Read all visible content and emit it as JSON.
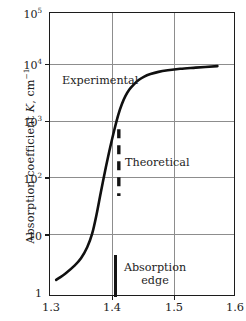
{
  "chart_data": {
    "type": "line",
    "title": "",
    "xlabel": "",
    "ylabel": "Absorption coefficient K, cm-1",
    "ylabel_parts": {
      "prefix": "Absorption coefficient ",
      "symbol": "K",
      "suffix": ", cm",
      "exponent": "-1"
    },
    "xlim": [
      1.3,
      1.6
    ],
    "ylim": [
      1,
      100000
    ],
    "yscale": "log",
    "xscale": "linear",
    "grid": "major-x-and-y",
    "legend": "none",
    "x_ticks": [
      "1.3",
      "1.4",
      "1.5",
      "1.6"
    ],
    "x_tick_values": [
      1.3,
      1.4,
      1.5,
      1.6
    ],
    "y_ticks": [
      "1",
      "10",
      "10^2",
      "10^3",
      "10^4",
      "10^5"
    ],
    "y_tick_values": [
      1,
      10,
      100,
      1000,
      10000,
      100000
    ],
    "y_tick_display": [
      {
        "mantissa": "1",
        "exp": ""
      },
      {
        "mantissa": "10",
        "exp": ""
      },
      {
        "mantissa": "10",
        "exp": "2"
      },
      {
        "mantissa": "10",
        "exp": "3"
      },
      {
        "mantissa": "10",
        "exp": "4"
      },
      {
        "mantissa": "10",
        "exp": "5"
      }
    ],
    "series": [
      {
        "name": "Experimental",
        "style": "solid",
        "color": "#101010",
        "x": [
          1.31,
          1.325,
          1.34,
          1.35,
          1.36,
          1.368,
          1.375,
          1.382,
          1.39,
          1.397,
          1.404,
          1.41,
          1.416,
          1.422,
          1.428,
          1.435,
          1.443,
          1.452,
          1.462,
          1.475,
          1.49,
          1.51,
          1.535,
          1.57
        ],
        "y": [
          2.0,
          2.6,
          3.6,
          4.8,
          7.5,
          13,
          28,
          70,
          190,
          430,
          900,
          1600,
          2500,
          3500,
          4500,
          5500,
          6600,
          7600,
          8400,
          9200,
          9800,
          10400,
          10900,
          11600
        ]
      }
    ],
    "annotations": [
      {
        "name": "experimental",
        "text": "Experimental",
        "x": 1.335,
        "y": 5000
      },
      {
        "name": "theoretical",
        "text": "Theoretical",
        "x": 1.423,
        "y": 260
      },
      {
        "name": "absorption-edge",
        "text": "Absorption edge",
        "line1": "Absorption",
        "line2": "edge",
        "x": 1.432,
        "y": 4.2
      }
    ],
    "markers": [
      {
        "name": "theoretical-dashed-line",
        "style": "dashed",
        "orientation": "vertical",
        "x": 1.411,
        "y_from": 60,
        "y_to": 900,
        "color": "#141414"
      },
      {
        "name": "absorption-edge-line",
        "style": "solid-thick",
        "orientation": "vertical",
        "x": 1.406,
        "y_from": 1,
        "y_to": 5.5,
        "color": "#141414"
      }
    ]
  },
  "annotations": {
    "experimental_label": "Experimental",
    "theoretical_label": "Theoretical",
    "edge_label_line1": "Absorption",
    "edge_label_line2": "edge"
  },
  "axes": {
    "y_title_prefix": "Absorption coefficient ",
    "y_title_symbol": "K",
    "y_title_suffix": ", cm",
    "y_title_exponent": "−1",
    "x_tick_labels": [
      "1.3",
      "1.4",
      "1.5",
      "1.6"
    ],
    "y_tick_labels": [
      {
        "mantissa": "1",
        "exp": ""
      },
      {
        "mantissa": "10",
        "exp": ""
      },
      {
        "mantissa": "10",
        "exp": "2"
      },
      {
        "mantissa": "10",
        "exp": "3"
      },
      {
        "mantissa": "10",
        "exp": "4"
      },
      {
        "mantissa": "10",
        "exp": "5"
      }
    ]
  },
  "colors": {
    "curve": "#101010",
    "grid": "#8d8d8d",
    "frame": "#1c1c1c",
    "text": "#1d1d1d",
    "background": "#ffffff"
  }
}
